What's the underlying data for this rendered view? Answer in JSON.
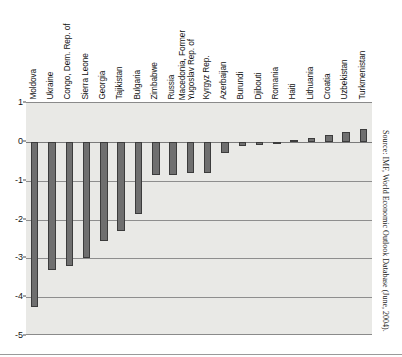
{
  "figure": {
    "source_note": "Source: IMF, World Economic Outlook Database (June, 2004)."
  },
  "chart_data": {
    "type": "bar",
    "title": "",
    "subtitle": "",
    "xlabel": "",
    "ylabel": "",
    "ylim": [
      -5,
      1
    ],
    "yticks": [
      1,
      0,
      -1,
      -2,
      -3,
      -4,
      -5
    ],
    "ytick_labels": [
      "1",
      "0",
      "-1",
      "-2",
      "-3",
      "-4",
      "-5"
    ],
    "grid": true,
    "legend": "none",
    "orientation": "vertical",
    "bar_color": "#6f6f6f",
    "bar_edge_color": "#3c3c3c",
    "plot_background": "#e9e9e6",
    "categories": [
      "Moldova",
      "Ukraine",
      "Congo, Dem. Rep. of",
      "Sierra Leone",
      "Georgia",
      "Tajikistan",
      "Bulgaria",
      "Zimbabwe",
      "Russia",
      "Macedonia, Former Yugoslav Rep. of",
      "Kyrgyz Rep.",
      "Azerbaijan",
      "Burundi",
      "Djibouti",
      "Romania",
      "Haiti",
      "Lithuania",
      "Croatia",
      "Uzbekistan",
      "Turkmenistan"
    ],
    "category_lines": [
      [
        "Moldova"
      ],
      [
        "Ukraine"
      ],
      [
        "Congo, Dem. Rep. of"
      ],
      [
        "Sierra Leone"
      ],
      [
        "Georgia"
      ],
      [
        "Tajikistan"
      ],
      [
        "Bulgaria"
      ],
      [
        "Zimbabwe"
      ],
      [
        "Russia"
      ],
      [
        "Macedonia, Former",
        "Yugoslav Rep. of"
      ],
      [
        "Kyrgyz Rep."
      ],
      [
        "Azerbaijan"
      ],
      [
        "Burundi"
      ],
      [
        "Djibouti"
      ],
      [
        "Romania"
      ],
      [
        "Haiti"
      ],
      [
        "Lithuania"
      ],
      [
        "Croatia"
      ],
      [
        "Uzbekistan"
      ],
      [
        "Turkmenistan"
      ]
    ],
    "values": [
      -4.25,
      -3.3,
      -3.2,
      -3.0,
      -2.55,
      -2.3,
      -1.85,
      -0.85,
      -0.85,
      -0.8,
      -0.8,
      -0.3,
      -0.1,
      -0.08,
      -0.05,
      0.05,
      0.1,
      0.17,
      0.25,
      0.32
    ]
  }
}
